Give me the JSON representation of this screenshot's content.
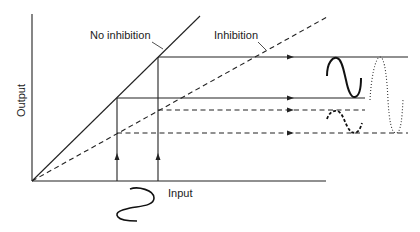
{
  "diagram": {
    "y_axis_label": "Output",
    "x_axis_label": "Input",
    "curves": [
      {
        "name": "no-inhibition",
        "label": "No inhibition",
        "style": "solid"
      },
      {
        "name": "inhibition",
        "label": "Inhibition",
        "style": "dashed"
      }
    ],
    "output_waveforms": [
      {
        "name": "no-inhibition-output",
        "style": "solid"
      },
      {
        "name": "inhibition-output",
        "style": "dashed"
      },
      {
        "name": "combined-output",
        "style": "dotted"
      }
    ],
    "input_waveform": {
      "name": "input-signal",
      "style": "solid"
    }
  }
}
